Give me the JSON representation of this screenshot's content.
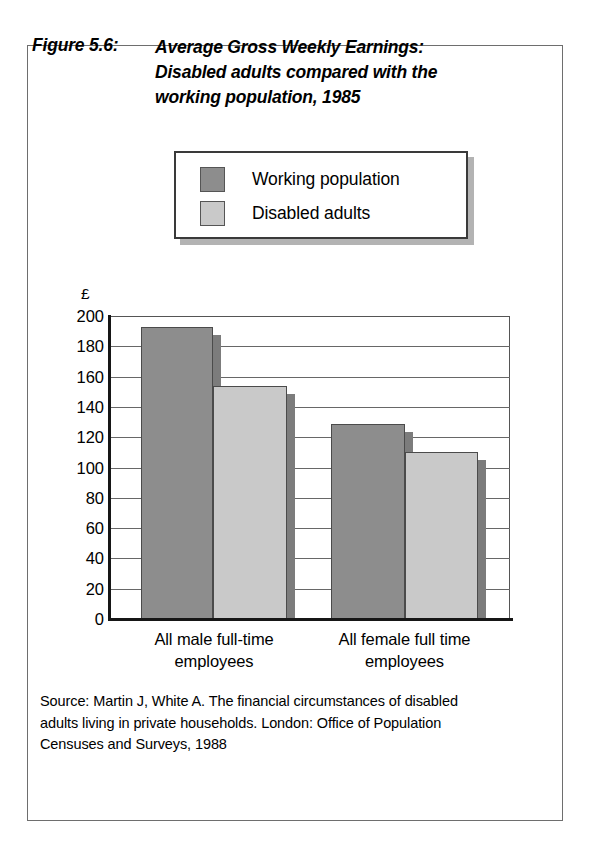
{
  "figure": {
    "number": "Figure 5.6:",
    "title_lines": [
      "Average Gross Weekly Earnings:",
      "Disabled adults compared with the",
      "working  population, 1985"
    ]
  },
  "legend": {
    "items": [
      {
        "label": "Working population",
        "color": "#8d8d8d"
      },
      {
        "label": "Disabled adults",
        "color": "#c9c9c9"
      }
    ]
  },
  "axis": {
    "currency_symbol": "£",
    "y_ticks": [
      "200",
      "180",
      "160",
      "140",
      "120",
      "100",
      "80",
      "60",
      "40",
      "20",
      "0"
    ]
  },
  "x_categories": [
    {
      "lines": [
        "All male full-time",
        "employees"
      ]
    },
    {
      "lines": [
        "All female full time",
        "employees"
      ]
    }
  ],
  "source": {
    "lines": [
      "Source: Martin J, White A. The financial circumstances of disabled",
      "adults living in private households. London: Office of Population",
      "Censuses and Surveys, 1988"
    ]
  },
  "chart_data": {
    "type": "bar",
    "title": "Average Gross Weekly Earnings: Disabled adults compared with the working population, 1985",
    "xlabel": "",
    "ylabel": "£",
    "ylim": [
      0,
      200
    ],
    "ytick_step": 20,
    "grid": true,
    "legend_position": "top-center",
    "categories": [
      "All male full-time employees",
      "All female full time employees"
    ],
    "series": [
      {
        "name": "Working population",
        "color": "#8d8d8d",
        "values": [
          193,
          129
        ]
      },
      {
        "name": "Disabled adults",
        "color": "#c9c9c9",
        "values": [
          154,
          110
        ]
      }
    ]
  }
}
